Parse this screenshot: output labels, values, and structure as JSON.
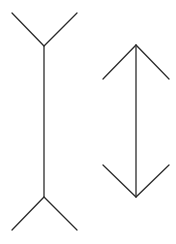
{
  "diagram": {
    "background": "#ffffff",
    "stroke_color": "#2b2b2b",
    "figures": [
      {
        "name": "fins-out-figure",
        "shaft": {
          "x": 44,
          "y1": 46,
          "y2": 197
        },
        "top_fin": {
          "left": [
            12,
            13
          ],
          "vertex": [
            44,
            46
          ],
          "right": [
            77,
            13
          ]
        },
        "bottom_fin": {
          "left": [
            12,
            230
          ],
          "vertex": [
            44,
            197
          ],
          "right": [
            77,
            230
          ]
        }
      },
      {
        "name": "arrows-in-figure",
        "shaft": {
          "x": 136,
          "y1": 45,
          "y2": 197
        },
        "top_fin": {
          "left": [
            103,
            79
          ],
          "vertex": [
            136,
            45
          ],
          "right": [
            169,
            79
          ]
        },
        "bottom_fin": {
          "left": [
            103,
            165
          ],
          "vertex": [
            136,
            197
          ],
          "right": [
            169,
            165
          ]
        }
      }
    ]
  }
}
